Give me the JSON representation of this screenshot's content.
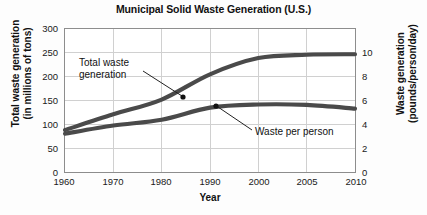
{
  "chart_data": {
    "type": "line",
    "title": "Municipal Solid Waste Generation (U.S.)",
    "xlabel": "Year",
    "ylabel": "Total waste generation (in millions of tons)",
    "ylabel_secondary": "Waste generation (pounds/person/day)",
    "categories": [
      "1960",
      "1970",
      "1980",
      "1990",
      "2000",
      "2005",
      "2010"
    ],
    "ylim": [
      0,
      300
    ],
    "yticks": [
      "0",
      "50",
      "100",
      "150",
      "200",
      "250",
      "300"
    ],
    "ylim_secondary": [
      0,
      10
    ],
    "yticks_secondary": [
      "0",
      "2",
      "4",
      "6",
      "8",
      "10"
    ],
    "grid": true,
    "legend": "annotations",
    "series": [
      {
        "name": "Total waste generation",
        "axis": "left",
        "units": "millions of tons",
        "values": [
          88,
          121,
          152,
          205,
          239,
          246,
          247
        ]
      },
      {
        "name": "Waste per person",
        "axis": "right",
        "units": "pounds/person/day",
        "values": [
          2.68,
          3.25,
          3.66,
          4.5,
          4.72,
          4.69,
          4.43
        ]
      }
    ],
    "annotations": [
      {
        "name": "total-waste-generation",
        "text_line1": "Total waste",
        "text_line2": "generation",
        "points_to_year": "1983",
        "points_to_value": 161
      },
      {
        "name": "waste-per-person",
        "text_line1": "Waste per person",
        "text_line2": "",
        "points_to_year": "1990",
        "points_to_value": 4.5
      }
    ]
  },
  "axes": {
    "left": {
      "title_line1": "Total waste generation",
      "title_line2": "(in millions of tons)",
      "ticks": [
        "300",
        "250",
        "200",
        "150",
        "100",
        "50",
        "0"
      ]
    },
    "right": {
      "title_line1": "Waste generation",
      "title_line2": "(pounds/person/day)",
      "ticks": [
        "10",
        "8",
        "6",
        "4",
        "2",
        "0"
      ]
    },
    "x": {
      "title": "Year",
      "ticks": [
        "1960",
        "1970",
        "1980",
        "1990",
        "2000",
        "2005",
        "2010"
      ]
    }
  },
  "annotations": {
    "total": {
      "line1": "Total waste",
      "line2": "generation"
    },
    "per_person": {
      "line1": "Waste per person"
    }
  },
  "colors": {
    "curve": "#4a4a4a",
    "grid": "#cfcfcf",
    "border": "#8d8d8d",
    "text": "#111111",
    "background": "#fdfdfd"
  }
}
